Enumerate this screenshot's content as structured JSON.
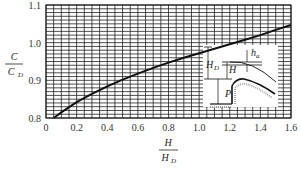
{
  "chart_data": {
    "type": "line",
    "title": "",
    "xlabel": "H / H_D",
    "ylabel": "C / C_D",
    "xlim": [
      0,
      1.6
    ],
    "ylim": [
      0.8,
      1.1
    ],
    "grid": true,
    "x_ticks": [
      "0",
      "0.2",
      "0.4",
      "0.6",
      "0.8",
      "1.0",
      "1.2",
      "1.4",
      "1.6"
    ],
    "y_ticks": [
      "0.8",
      "0.9",
      "1.0",
      "1.1"
    ],
    "series": [
      {
        "name": "C/C_D vs H/H_D",
        "x": [
          0.05,
          0.1,
          0.2,
          0.3,
          0.4,
          0.5,
          0.6,
          0.7,
          0.8,
          0.9,
          1.0,
          1.1,
          1.2,
          1.3,
          1.4,
          1.5,
          1.6
        ],
        "y": [
          0.8,
          0.815,
          0.842,
          0.864,
          0.884,
          0.902,
          0.918,
          0.933,
          0.947,
          0.96,
          0.972,
          0.984,
          0.996,
          1.008,
          1.02,
          1.034,
          1.047
        ]
      }
    ],
    "inset": {
      "description": "Spillway crest sketch",
      "labels": [
        "H_D",
        "H",
        "h_a",
        "P"
      ]
    }
  },
  "axis": {
    "y_num": "C",
    "y_den": "C",
    "y_den_sub": "D",
    "x_num": "H",
    "x_den": "H",
    "x_den_sub": "D"
  },
  "inset": {
    "hd": "H",
    "hd_sub": "D",
    "h": "H",
    "ha": "h",
    "ha_sub": "a",
    "p": "P"
  }
}
